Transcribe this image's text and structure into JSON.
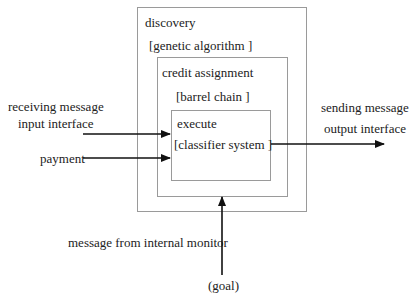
{
  "diagram": {
    "outer_box": {
      "title": "discovery",
      "subtitle": "[genetic algorithm ]"
    },
    "middle_box": {
      "title": "credit assignment",
      "subtitle": "[barrel chain ]"
    },
    "inner_box": {
      "title": "execute",
      "subtitle": "[classifier system ]"
    },
    "inputs": {
      "line1": "receiving message",
      "line2": "input interface",
      "payment": "payment"
    },
    "outputs": {
      "line1": "sending message",
      "line2": "output interface"
    },
    "monitor": {
      "label": "message from internal monitor",
      "goal": "(goal)"
    },
    "colors": {
      "box_border": "#9a9a9a",
      "arrow": "#111111",
      "text": "#222222"
    }
  }
}
